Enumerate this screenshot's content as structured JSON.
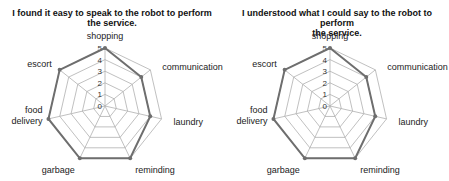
{
  "chart_data": [
    {
      "type": "radar",
      "title": "I found it easy to speak to the robot to perform the service.",
      "title_lines": [
        "I found it easy to speak to the robot to perform",
        "the service."
      ],
      "categories": [
        "shopping",
        "communication",
        "laundry",
        "reminding",
        "garbage",
        "food delivery",
        "escort"
      ],
      "values": [
        5,
        4,
        4,
        5,
        5,
        5,
        5
      ],
      "rlim": [
        0,
        5
      ],
      "ticks": [
        0,
        1,
        2,
        3,
        4,
        5
      ],
      "grid": true,
      "legend": "none"
    },
    {
      "type": "radar",
      "title": "I understood what I could say to the robot to perform the service.",
      "title_lines": [
        "I understood what I could say to the robot to perform",
        "the service."
      ],
      "categories": [
        "shopping",
        "communication",
        "laundry",
        "reminding",
        "garbage",
        "food delivery",
        "escort"
      ],
      "values": [
        5,
        4,
        4,
        5,
        5,
        5,
        5
      ],
      "rlim": [
        0,
        5
      ],
      "ticks": [
        0,
        1,
        2,
        3,
        4,
        5
      ],
      "grid": true,
      "legend": "none"
    }
  ],
  "colors": {
    "grid": "#b0b0b0",
    "series": "#6e6e6e",
    "text": "#222222"
  }
}
